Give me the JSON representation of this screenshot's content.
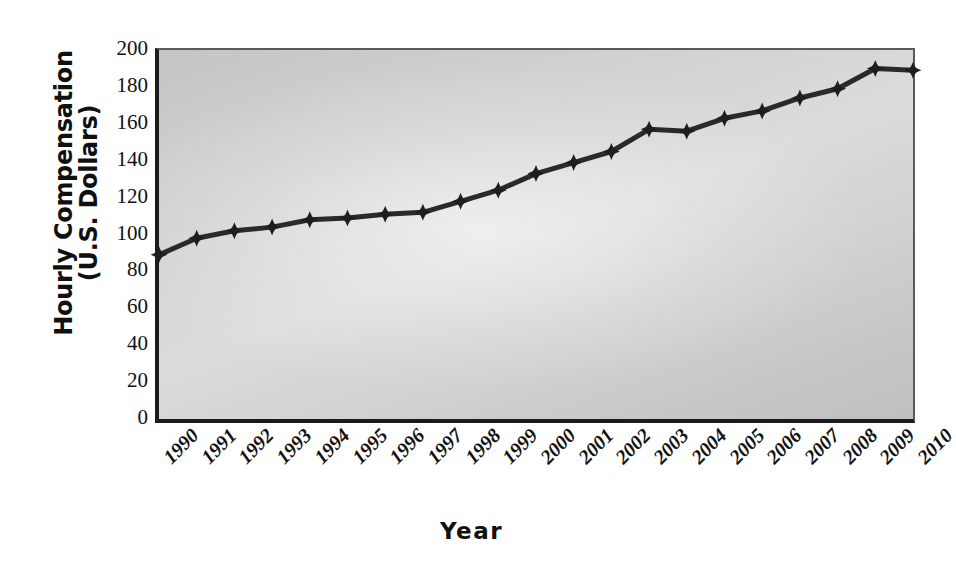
{
  "chart_data": {
    "type": "line",
    "title": "",
    "xlabel": "Year",
    "ylabel": "Hourly Compensation (U.S. Dollars)",
    "ylabel_line1": "Hourly Compensation",
    "ylabel_line2": "(U.S. Dollars)",
    "categories": [
      "1990",
      "1991",
      "1992",
      "1993",
      "1994",
      "1995",
      "1996",
      "1997",
      "1998",
      "1999",
      "2000",
      "2001",
      "2002",
      "2003",
      "2004",
      "2005",
      "2006",
      "2007",
      "2008",
      "2009",
      "2010"
    ],
    "values": [
      89,
      98,
      102,
      104,
      108,
      109,
      111,
      112,
      118,
      124,
      133,
      139,
      145,
      157,
      156,
      163,
      167,
      174,
      179,
      190,
      189
    ],
    "series": [
      {
        "name": "Hourly Compensation",
        "values": [
          89,
          98,
          102,
          104,
          108,
          109,
          111,
          112,
          118,
          124,
          133,
          139,
          145,
          157,
          156,
          163,
          167,
          174,
          179,
          190,
          189
        ]
      }
    ],
    "ylim": [
      0,
      200
    ],
    "y_ticks": [
      200,
      180,
      160,
      140,
      120,
      100,
      80,
      60,
      40,
      20,
      0
    ],
    "grid": false,
    "legend": "none",
    "marker": "diamond",
    "line_color": "#2a2a2a",
    "marker_color": "#1e1e1e",
    "plot_background": "#d2d2d2",
    "axis_color": "#1b1b1b",
    "x_tick_rotation": -45
  }
}
